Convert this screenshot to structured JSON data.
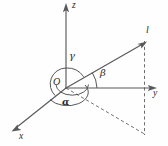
{
  "figure": {
    "background_color": "#fefefe",
    "stroke_color": "#58595b",
    "label_color": "#2b2b2b",
    "axes": [
      {
        "id": "z",
        "label": "z",
        "label_x": 72,
        "label_y": 2
      },
      {
        "id": "y",
        "label": "y",
        "label_x": 153,
        "label_y": 89
      },
      {
        "id": "x",
        "label": "x",
        "label_x": 19,
        "label_y": 133
      }
    ],
    "origin": {
      "label": "O",
      "label_x": 53,
      "label_y": 77
    },
    "ray": {
      "label": "l",
      "label_x": 146,
      "label_y": 26
    },
    "angles": [
      {
        "id": "gamma",
        "label": "γ",
        "label_x": 69,
        "label_y": 52
      },
      {
        "id": "beta",
        "label": "β",
        "label_x": 100,
        "label_y": 69
      },
      {
        "id": "alpha",
        "label": "α",
        "label_x": 62,
        "label_y": 97
      }
    ]
  }
}
